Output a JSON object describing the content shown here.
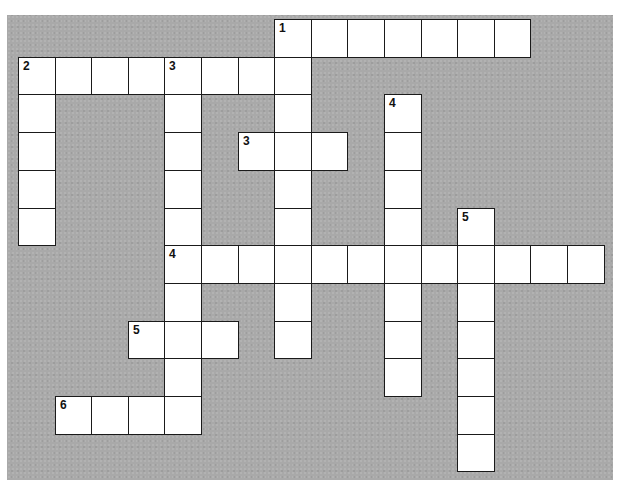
{
  "puzzle": {
    "type": "crossword",
    "grid": {
      "origin_x": 18,
      "origin_y": 19,
      "cell_w": 36.6,
      "cell_h": 37.7,
      "cols": 16,
      "rows": 12
    },
    "colors": {
      "background": "#a9a9a9",
      "cell": "#ffffff",
      "border": "#1a1a1a"
    },
    "entries": [
      {
        "number": "1",
        "direction": "across",
        "row": 0,
        "col": 7,
        "length": 7
      },
      {
        "number": "1",
        "direction": "down",
        "row": 0,
        "col": 7,
        "length": 9
      },
      {
        "number": "2",
        "direction": "across",
        "row": 1,
        "col": 0,
        "length": 8
      },
      {
        "number": "2",
        "direction": "down",
        "row": 1,
        "col": 0,
        "length": 5
      },
      {
        "number": "3",
        "direction": "down",
        "row": 1,
        "col": 4,
        "length": 10
      },
      {
        "number": "3",
        "direction": "across",
        "row": 3,
        "col": 6,
        "length": 3
      },
      {
        "number": "4",
        "direction": "down",
        "row": 2,
        "col": 10,
        "length": 8
      },
      {
        "number": "4",
        "direction": "across",
        "row": 6,
        "col": 4,
        "length": 12
      },
      {
        "number": "5",
        "direction": "down",
        "row": 5,
        "col": 12,
        "length": 7
      },
      {
        "number": "5",
        "direction": "across",
        "row": 8,
        "col": 3,
        "length": 3
      },
      {
        "number": "6",
        "direction": "across",
        "row": 10,
        "col": 1,
        "length": 4
      }
    ],
    "labels": [
      {
        "text": "1",
        "row": 0,
        "col": 7
      },
      {
        "text": "2",
        "row": 1,
        "col": 0
      },
      {
        "text": "3",
        "row": 1,
        "col": 4
      },
      {
        "text": "3",
        "row": 3,
        "col": 6
      },
      {
        "text": "4",
        "row": 2,
        "col": 10
      },
      {
        "text": "4",
        "row": 6,
        "col": 4
      },
      {
        "text": "5",
        "row": 5,
        "col": 12
      },
      {
        "text": "5",
        "row": 8,
        "col": 3
      },
      {
        "text": "6",
        "row": 10,
        "col": 1
      }
    ]
  }
}
